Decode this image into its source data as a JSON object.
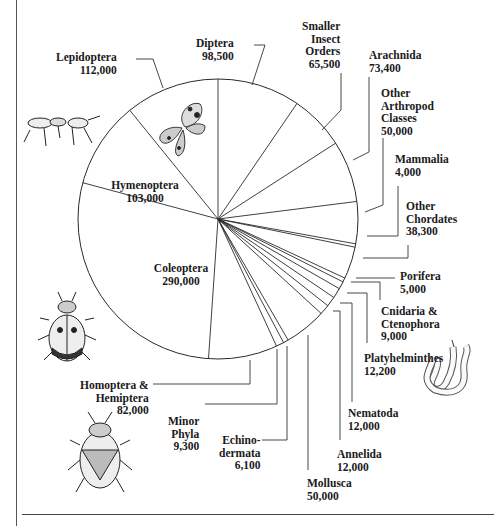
{
  "chart_data": {
    "type": "pie",
    "title": "",
    "unit": "described species",
    "start_angle_deg": 0,
    "direction": "clockwise",
    "slices": [
      {
        "name": "Diptera",
        "value": 98500,
        "label": "Diptera\n98,500"
      },
      {
        "name": "Smaller Insect Orders",
        "value": 65500,
        "label": "Smaller\nInsect\nOrders\n65,500"
      },
      {
        "name": "Arachnida",
        "value": 73400,
        "label": "Arachnida\n73,400"
      },
      {
        "name": "Other Arthropod Classes",
        "value": 50000,
        "label": "Other\nArthropod\nClasses\n50,000"
      },
      {
        "name": "Mammalia",
        "value": 4000,
        "label": "Mammalia\n4,000"
      },
      {
        "name": "Other Chordates",
        "value": 38300,
        "label": "Other\nChordates\n38,300"
      },
      {
        "name": "Porifera",
        "value": 5000,
        "label": "Porifera\n5,000"
      },
      {
        "name": "Cnidaria & Ctenophora",
        "value": 9000,
        "label": "Cnidaria &\nCtenophora\n9,000"
      },
      {
        "name": "Platyhelminthes",
        "value": 12200,
        "label": "Platyhelminthes\n12,200"
      },
      {
        "name": "Nematoda",
        "value": 12000,
        "label": "Nematoda\n12,000"
      },
      {
        "name": "Annelida",
        "value": 12000,
        "label": "Annelida\n12,000"
      },
      {
        "name": "Mollusca",
        "value": 50000,
        "label": "Mollusca\n50,000"
      },
      {
        "name": "Echinodermata",
        "value": 6100,
        "label": "Echino-\ndermata\n6,100"
      },
      {
        "name": "Minor Phyla",
        "value": 9300,
        "label": "Minor\nPhyla\n9,300"
      },
      {
        "name": "Homoptera & Hemiptera",
        "value": 82000,
        "label": "Homoptera &\nHemiptera\n82,000"
      },
      {
        "name": "Coleoptera",
        "value": 290000,
        "label": "Coleoptera\n290,000"
      },
      {
        "name": "Hymenoptera",
        "value": 103000,
        "label": "Hymenoptera\n103,000"
      },
      {
        "name": "Lepidoptera",
        "value": 112000,
        "label": "Lepidoptera\n112,000"
      }
    ],
    "legend": "none",
    "illustrations": [
      "ant",
      "butterfly",
      "ladybird-beetle",
      "stink-bug",
      "annelid-worm"
    ]
  },
  "labels": {
    "diptera": "Diptera\n98,500",
    "smaller_insect": "Smaller\nInsect\nOrders\n65,500",
    "arachnida": "Arachnida\n73,400",
    "other_arthropod": "Other\nArthropod\nClasses\n50,000",
    "mammalia": "Mammalia\n4,000",
    "other_chordates": "Other\nChordates\n38,300",
    "porifera": "Porifera\n5,000",
    "cnidaria": "Cnidaria &\nCtenophora\n9,000",
    "platyhelminthes": "Platyhelminthes\n12,200",
    "nematoda": "Nematoda\n12,000",
    "annelida": "Annelida\n12,000",
    "mollusca": "Mollusca\n50,000",
    "echinodermata": "Echino-\ndermata\n6,100",
    "minor_phyla": "Minor\nPhyla\n9,300",
    "homoptera": "Homoptera &\nHemiptera\n82,000",
    "coleoptera": "Coleoptera\n290,000",
    "hymenoptera": "Hymenoptera\n103,000",
    "lepidoptera": "Lepidoptera\n112,000"
  },
  "style": {
    "line_color": "#2a2a2a",
    "text_color": "#1a1a1a",
    "background": "#ffffff"
  }
}
